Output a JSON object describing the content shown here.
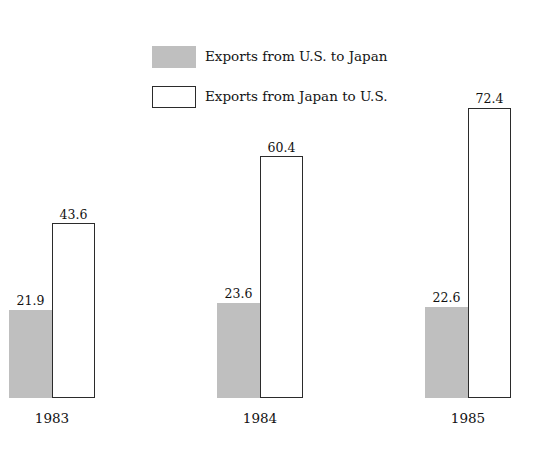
{
  "chart_data": {
    "type": "bar",
    "title": "",
    "subtitle": "",
    "xlabel": "",
    "ylabel": "",
    "categories": [
      "1983",
      "1984",
      "1985"
    ],
    "series": [
      {
        "name": "Exports from U.S. to Japan",
        "style": "filled-gray",
        "color": "#bfbfbf",
        "values": [
          21.9,
          23.6,
          22.6
        ],
        "labels": [
          "21.9",
          "23.6",
          "22.6"
        ]
      },
      {
        "name": "Exports from Japan to U.S.",
        "style": "white-outline",
        "color": "#ffffff",
        "border_color": "#2b2b2b",
        "values": [
          43.6,
          60.4,
          72.4
        ],
        "labels": [
          "43.6",
          "60.4",
          "72.4"
        ]
      }
    ],
    "ylim": [
      0,
      80
    ],
    "grid": false,
    "axis_visible": false,
    "legend_position": "top-center",
    "data_labels": true
  },
  "legend": {
    "items": [
      {
        "label": "Exports from U.S. to Japan",
        "swatch": "filled-gray-swatch"
      },
      {
        "label": "Exports from Japan to U.S.",
        "swatch": "white-outline-swatch"
      }
    ]
  },
  "colors": {
    "gray_fill": "#bfbfbf",
    "outline": "#2b2b2b",
    "background": "#ffffff",
    "text": "#111111"
  }
}
